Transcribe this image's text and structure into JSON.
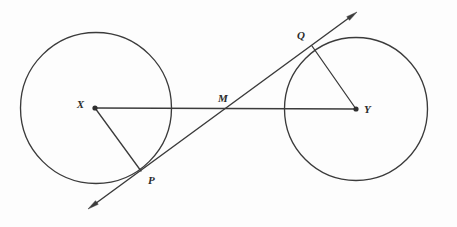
{
  "figure": {
    "background_color": "#fdfdfd",
    "stroke_color": "#3b3b3b",
    "label_color": "#2b2b2b",
    "width": 457,
    "height": 227
  },
  "labels": {
    "center_left": "X",
    "center_right": "Y",
    "tangent_left": "P",
    "tangent_right": "Q",
    "midpoint": "M"
  },
  "chart_data": {
    "type": "scatter",
    "xlabel": "",
    "ylabel": "",
    "xlim": [
      0,
      457
    ],
    "ylim": [
      227,
      0
    ],
    "grid": false,
    "legend": "none",
    "circles": [
      {
        "name": "left-circle",
        "center_label": "X",
        "cx": 96,
        "cy": 108,
        "r": 75.5,
        "stroke": "#3b3b3b",
        "fill": "none"
      },
      {
        "name": "right-circle",
        "center_label": "Y",
        "cx": 356,
        "cy": 109,
        "r": 71.5,
        "stroke": "#3b3b3b",
        "fill": "none"
      }
    ],
    "points": [
      {
        "label": "X",
        "x": 95,
        "y": 108,
        "kind": "center",
        "dot": true,
        "label_x": 84,
        "label_y": 105,
        "label_anchor": "end"
      },
      {
        "label": "Y",
        "x": 356,
        "y": 109,
        "kind": "center",
        "dot": true,
        "label_x": 364,
        "label_y": 110,
        "label_anchor": "start"
      },
      {
        "label": "P",
        "x": 141,
        "y": 171,
        "kind": "tangency",
        "dot": false,
        "label_x": 148,
        "label_y": 181,
        "label_anchor": "start"
      },
      {
        "label": "Q",
        "x": 312,
        "y": 46,
        "kind": "tangency",
        "dot": false,
        "label_x": 305,
        "label_y": 36,
        "label_anchor": "end"
      },
      {
        "label": "M",
        "x": 229,
        "y": 109,
        "kind": "intersection",
        "dot": false,
        "label_x": 223,
        "label_y": 99,
        "label_anchor": "middle"
      }
    ],
    "segments": [
      {
        "name": "segment-XY",
        "from": "X",
        "to": "Y",
        "x1": 95,
        "y1": 108,
        "x2": 356,
        "y2": 109,
        "through": [
          "M"
        ]
      },
      {
        "name": "radius-XP",
        "from": "X",
        "to": "P",
        "x1": 95,
        "y1": 108,
        "x2": 141,
        "y2": 171
      },
      {
        "name": "radius-YQ",
        "from": "Y",
        "to": "Q",
        "x1": 356,
        "y1": 109,
        "x2": 312,
        "y2": 46
      }
    ],
    "lines": [
      {
        "name": "transversal-PQ",
        "kind": "double-arrow-line",
        "x1": 88,
        "y1": 209,
        "x2": 357,
        "y2": 12,
        "through": [
          "P",
          "M",
          "Q"
        ],
        "arrow_start": true,
        "arrow_end": true
      }
    ]
  }
}
